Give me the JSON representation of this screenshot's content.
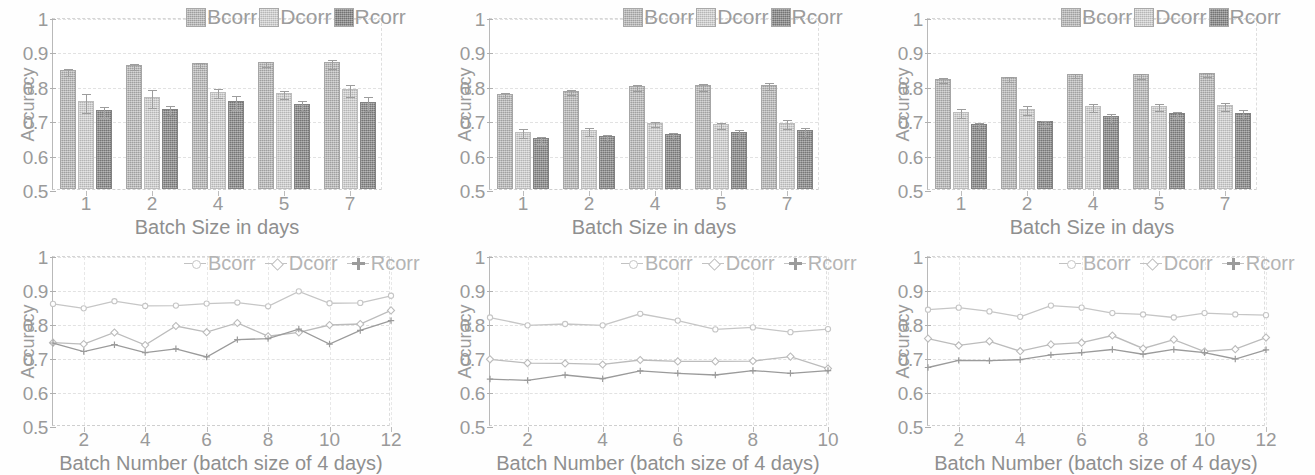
{
  "figure": {
    "panel_count": 6,
    "rows": 2,
    "cols": 3,
    "background": "#ffffff"
  },
  "axis_common": {
    "ylabel": "Accuracy",
    "yticks": [
      "0.5",
      "0.6",
      "0.7",
      "0.8",
      "0.9",
      "1"
    ],
    "ylim": [
      0.5,
      1.0
    ],
    "bar_xlabel": "Batch Size in days",
    "line_xlabel": "Batch Number (batch size of 4 days)",
    "bar_xticks": [
      "1",
      "2",
      "4",
      "5",
      "7"
    ],
    "series_names": [
      "Bcorr",
      "Dcorr",
      "Rcorr"
    ],
    "colors": {
      "Bcorr": "#b3b3b3",
      "Dcorr": "#c9c9c9",
      "Rcorr": "#8e8e8e",
      "axis": "#b0b0b0",
      "grid": "#e2e2e2",
      "text": "#9a9a9a"
    }
  },
  "chart_data": [
    {
      "id": "bar-chart-1",
      "position": "top-left",
      "type": "bar",
      "title": "",
      "xlabel": "Batch Size in days",
      "ylabel": "Accuracy",
      "ylim": [
        0.5,
        1.0
      ],
      "yticks": [
        0.5,
        0.6,
        0.7,
        0.8,
        0.9,
        1.0
      ],
      "grid": true,
      "legend": [
        "Bcorr",
        "Dcorr",
        "Rcorr"
      ],
      "legend_position": "top-right",
      "categories": [
        "1",
        "2",
        "4",
        "5",
        "7"
      ],
      "series": [
        {
          "name": "Bcorr",
          "values": [
            0.845,
            0.86,
            0.865,
            0.868,
            0.868
          ],
          "errors": [
            0.01,
            0.008,
            0.007,
            0.008,
            0.013
          ]
        },
        {
          "name": "Dcorr",
          "values": [
            0.755,
            0.767,
            0.783,
            0.778,
            0.79
          ],
          "errors": [
            0.028,
            0.027,
            0.013,
            0.012,
            0.018
          ]
        },
        {
          "name": "Rcorr",
          "values": [
            0.729,
            0.733,
            0.756,
            0.748,
            0.752
          ],
          "errors": [
            0.016,
            0.013,
            0.02,
            0.015,
            0.02
          ]
        }
      ]
    },
    {
      "id": "bar-chart-2",
      "position": "top-middle",
      "type": "bar",
      "title": "",
      "xlabel": "Batch Size in days",
      "ylabel": "Accuracy",
      "ylim": [
        0.5,
        1.0
      ],
      "yticks": [
        0.5,
        0.6,
        0.7,
        0.8,
        0.9,
        1.0
      ],
      "grid": true,
      "legend": [
        "Bcorr",
        "Dcorr",
        "Rcorr"
      ],
      "legend_position": "top-right",
      "categories": [
        "1",
        "2",
        "4",
        "5",
        "7"
      ],
      "series": [
        {
          "name": "Bcorr",
          "values": [
            0.777,
            0.786,
            0.8,
            0.801,
            0.803
          ],
          "errors": [
            0.008,
            0.007,
            0.009,
            0.009,
            0.01
          ]
        },
        {
          "name": "Dcorr",
          "values": [
            0.667,
            0.671,
            0.693,
            0.689,
            0.693
          ],
          "errors": [
            0.013,
            0.012,
            0.008,
            0.009,
            0.012
          ]
        },
        {
          "name": "Rcorr",
          "values": [
            0.647,
            0.654,
            0.66,
            0.665,
            0.671
          ],
          "errors": [
            0.011,
            0.008,
            0.009,
            0.013,
            0.013
          ]
        }
      ]
    },
    {
      "id": "bar-chart-3",
      "position": "top-right",
      "type": "bar",
      "title": "",
      "xlabel": "Batch Size in days",
      "ylabel": "Accuracy",
      "ylim": [
        0.5,
        1.0
      ],
      "yticks": [
        0.5,
        0.6,
        0.7,
        0.8,
        0.9,
        1.0
      ],
      "grid": true,
      "legend": [
        "Bcorr",
        "Dcorr",
        "Rcorr"
      ],
      "legend_position": "top-right",
      "categories": [
        "1",
        "2",
        "4",
        "5",
        "7"
      ],
      "series": [
        {
          "name": "Bcorr",
          "values": [
            0.821,
            0.825,
            0.834,
            0.833,
            0.838
          ],
          "errors": [
            0.007,
            0.007,
            0.006,
            0.007,
            0.006
          ]
        },
        {
          "name": "Dcorr",
          "values": [
            0.724,
            0.734,
            0.742,
            0.742,
            0.744
          ],
          "errors": [
            0.013,
            0.013,
            0.011,
            0.01,
            0.011
          ]
        },
        {
          "name": "Rcorr",
          "values": [
            0.689,
            0.697,
            0.711,
            0.721,
            0.722
          ],
          "errors": [
            0.01,
            0.007,
            0.013,
            0.009,
            0.013
          ]
        }
      ]
    },
    {
      "id": "line-chart-1",
      "position": "bottom-left",
      "type": "line",
      "title": "",
      "xlabel": "Batch Number (batch size of 4 days)",
      "ylabel": "Accuracy",
      "ylim": [
        0.5,
        1.0
      ],
      "yticks": [
        0.5,
        0.6,
        0.7,
        0.8,
        0.9,
        1.0
      ],
      "xlim": [
        1,
        12
      ],
      "xticks": [
        2,
        4,
        6,
        8,
        10,
        12
      ],
      "grid": true,
      "legend": [
        "Bcorr",
        "Dcorr",
        "Rcorr"
      ],
      "legend_position": "top-right",
      "x": [
        1,
        2,
        3,
        4,
        5,
        6,
        7,
        8,
        9,
        10,
        11,
        12
      ],
      "series": [
        {
          "name": "Bcorr",
          "values": [
            0.862,
            0.849,
            0.87,
            0.856,
            0.857,
            0.863,
            0.866,
            0.855,
            0.899,
            0.864,
            0.865,
            0.886
          ]
        },
        {
          "name": "Dcorr",
          "values": [
            0.748,
            0.744,
            0.778,
            0.741,
            0.797,
            0.779,
            0.806,
            0.767,
            0.778,
            0.8,
            0.803,
            0.843
          ]
        },
        {
          "name": "Rcorr",
          "values": [
            0.747,
            0.722,
            0.742,
            0.719,
            0.73,
            0.706,
            0.757,
            0.76,
            0.788,
            0.744,
            0.784,
            0.813
          ]
        }
      ]
    },
    {
      "id": "line-chart-2",
      "position": "bottom-middle",
      "type": "line",
      "title": "",
      "xlabel": "Batch Number (batch size of 4 days)",
      "ylabel": "Accuracy",
      "ylim": [
        0.5,
        1.0
      ],
      "yticks": [
        0.5,
        0.6,
        0.7,
        0.8,
        0.9,
        1.0
      ],
      "xlim": [
        1,
        10
      ],
      "xticks": [
        2,
        4,
        6,
        8,
        10
      ],
      "grid": true,
      "legend": [
        "Bcorr",
        "Dcorr",
        "Rcorr"
      ],
      "legend_position": "top-right",
      "x": [
        1,
        2,
        3,
        4,
        5,
        6,
        7,
        8,
        9,
        10
      ],
      "series": [
        {
          "name": "Bcorr",
          "values": [
            0.822,
            0.799,
            0.803,
            0.799,
            0.833,
            0.813,
            0.787,
            0.793,
            0.779,
            0.788
          ]
        },
        {
          "name": "Dcorr",
          "values": [
            0.699,
            0.688,
            0.687,
            0.684,
            0.697,
            0.693,
            0.693,
            0.694,
            0.707,
            0.672
          ]
        },
        {
          "name": "Rcorr",
          "values": [
            0.641,
            0.637,
            0.653,
            0.642,
            0.665,
            0.658,
            0.653,
            0.666,
            0.658,
            0.666
          ]
        }
      ]
    },
    {
      "id": "line-chart-3",
      "position": "bottom-right",
      "type": "line",
      "title": "",
      "xlabel": "Batch Number (batch size of 4 days)",
      "ylabel": "Accuracy",
      "ylim": [
        0.5,
        1.0
      ],
      "yticks": [
        0.5,
        0.6,
        0.7,
        0.8,
        0.9,
        1.0
      ],
      "xlim": [
        1,
        12
      ],
      "xticks": [
        2,
        4,
        6,
        8,
        10,
        12
      ],
      "grid": true,
      "legend": [
        "Bcorr",
        "Dcorr",
        "Rcorr"
      ],
      "legend_position": "top-right",
      "x": [
        1,
        2,
        3,
        4,
        5,
        6,
        7,
        8,
        9,
        10,
        11,
        12
      ],
      "series": [
        {
          "name": "Bcorr",
          "values": [
            0.845,
            0.851,
            0.84,
            0.824,
            0.857,
            0.851,
            0.835,
            0.831,
            0.822,
            0.835,
            0.831,
            0.829
          ]
        },
        {
          "name": "Dcorr",
          "values": [
            0.76,
            0.74,
            0.752,
            0.723,
            0.743,
            0.748,
            0.769,
            0.731,
            0.757,
            0.722,
            0.729,
            0.763
          ]
        },
        {
          "name": "Rcorr",
          "values": [
            0.675,
            0.696,
            0.695,
            0.698,
            0.712,
            0.719,
            0.728,
            0.714,
            0.728,
            0.719,
            0.7,
            0.727
          ]
        }
      ]
    }
  ]
}
